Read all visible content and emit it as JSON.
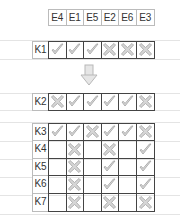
{
  "header": {
    "labels": [
      "E4",
      "E1",
      "E5",
      "E2",
      "E6",
      "E3"
    ]
  },
  "symbols": {
    "check": "check-icon",
    "cross": "cross-icon",
    "empty": ""
  },
  "colors": {
    "grid_border": "#444444",
    "header_border": "#bbbbbb",
    "icon_fill": "#d0d0d0",
    "icon_stroke": "#a8a8a8",
    "guide_line": "#e4e4e4"
  },
  "blocks": [
    {
      "rows": [
        {
          "label": "K1",
          "cells": [
            "check",
            "check",
            "check",
            "cross",
            "cross",
            "cross"
          ]
        }
      ]
    },
    {
      "rows": [
        {
          "label": "K2",
          "cells": [
            "cross",
            "check",
            "check",
            "check",
            "check",
            "cross"
          ]
        }
      ]
    },
    {
      "rows": [
        {
          "label": "K3",
          "cells": [
            "check",
            "check",
            "cross",
            "check",
            "check",
            "cross"
          ]
        },
        {
          "label": "K4",
          "cells": [
            "",
            "cross",
            "",
            "cross",
            "",
            "check"
          ]
        },
        {
          "label": "K5",
          "cells": [
            "",
            "cross",
            "",
            "check",
            "",
            "check"
          ]
        },
        {
          "label": "K6",
          "cells": [
            "",
            "cross",
            "",
            "check",
            "",
            "check"
          ]
        },
        {
          "label": "K7",
          "cells": [
            "",
            "cross",
            "",
            "cross",
            "",
            "cross"
          ]
        }
      ]
    }
  ],
  "arrow": {
    "icon": "down-arrow-icon"
  }
}
